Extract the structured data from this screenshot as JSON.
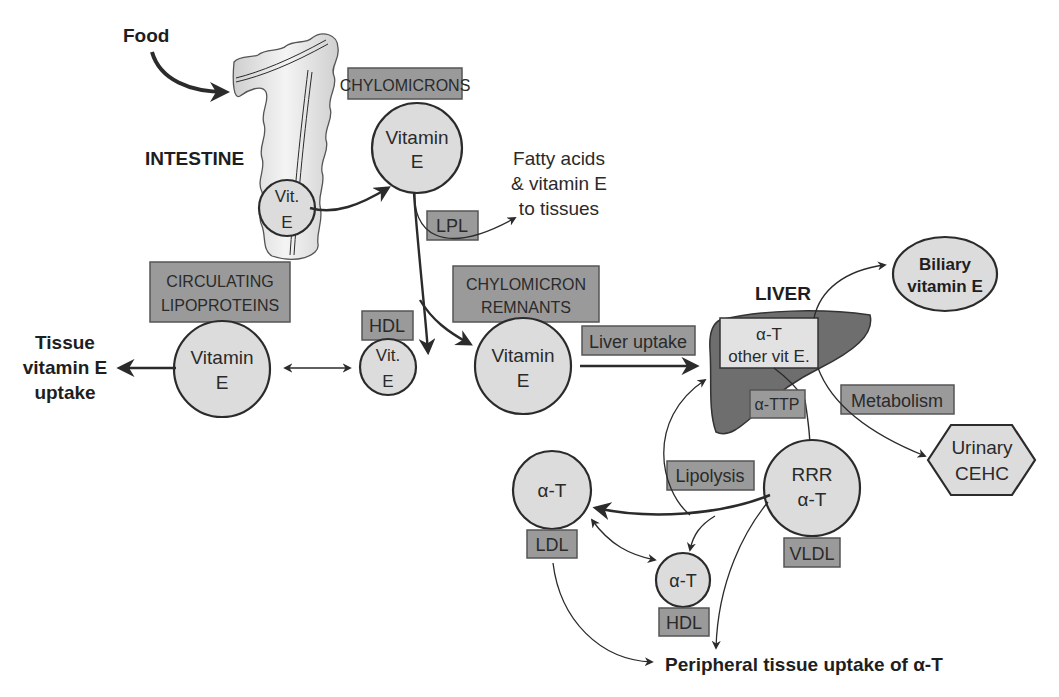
{
  "diagram": {
    "title_labels": {
      "food": "Food",
      "intestine": "INTESTINE",
      "liver": "LIVER",
      "tissue_uptake": [
        "Tissue",
        "vitamin E",
        "uptake"
      ],
      "peripheral": "Peripheral tissue uptake of α-T",
      "fatty_acids": [
        "Fatty acids",
        "& vitamin E",
        "to tissues"
      ]
    },
    "boxes": {
      "chylomicrons": "CHYLOMICRONS",
      "lpl": "LPL",
      "circulating": [
        "CIRCULATING",
        "LIPOPROTEINS"
      ],
      "hdl_top": "HDL",
      "remnants": [
        "CHYLOMICRON",
        "REMNANTS"
      ],
      "liver_uptake": "Liver uptake",
      "alpha_t_liver": [
        "α-T",
        "other vit E."
      ],
      "attp": "α-TTP",
      "metabolism": "Metabolism",
      "lipolysis": "Lipolysis",
      "ldl": "LDL",
      "vldl": "VLDL",
      "hdl_bottom": "HDL"
    },
    "nodes": {
      "intestine_vit_e": [
        "Vit.",
        "E"
      ],
      "chylo_vit_e": [
        "Vitamin",
        "E"
      ],
      "circ_vit_e": [
        "Vitamin",
        "E"
      ],
      "hdl_vit_e": [
        "Vit.",
        "E"
      ],
      "remnant_vit_e": [
        "Vitamin",
        "E"
      ],
      "ldl_at": "α-T",
      "hdl_at": "α-T",
      "vldl_rrr": [
        "RRR",
        "α-T"
      ],
      "biliary": [
        "Biliary",
        "vitamin E"
      ],
      "urinary": [
        "Urinary",
        "CEHC"
      ]
    },
    "colors": {
      "node_fill": "#dcdcdc",
      "box_fill": "#9a9a9a",
      "liver_fill": "#6e6e6e",
      "stroke": "#2b2b2b"
    }
  }
}
